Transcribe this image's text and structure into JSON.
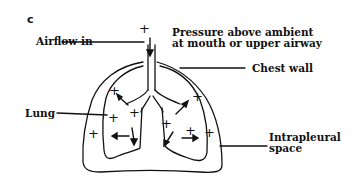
{
  "figure": {
    "panel_letter": "c"
  },
  "labels": {
    "airflow_in": "Airflow in",
    "pressure_line1": "Pressure above ambient",
    "pressure_line2": "at mouth or upper airway",
    "chest_wall": "Chest wall",
    "lung": "Lung",
    "intrapleural_line1": "Intrapleural",
    "intrapleural_line2": "space"
  },
  "symbols": {
    "plus": "+",
    "plus_mouth": "+"
  },
  "colors": {
    "line": "#111111",
    "background": "#ffffff"
  }
}
